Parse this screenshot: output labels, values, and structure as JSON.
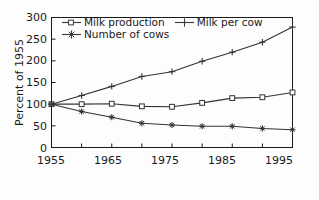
{
  "chart_data": {
    "type": "line",
    "title": "",
    "xlabel": "",
    "ylabel": "Percent of 1955",
    "x": [
      1955,
      1960,
      1965,
      1970,
      1975,
      1980,
      1985,
      1990,
      1995
    ],
    "xlim": [
      1955,
      1995
    ],
    "ylim": [
      0,
      300
    ],
    "xticks": [
      1955,
      1960,
      1965,
      1970,
      1975,
      1980,
      1985,
      1990,
      1995
    ],
    "xticklabels": [
      "1955",
      "",
      "1965",
      "",
      "1975",
      "",
      "1985",
      "",
      "1995"
    ],
    "yticks": [
      0,
      50,
      100,
      150,
      200,
      250,
      300
    ],
    "yticklabels": [
      "0",
      "50",
      "100",
      "150",
      "200",
      "250",
      "300"
    ],
    "grid": false,
    "legend_position": "upper left (inside axes)",
    "series": [
      {
        "name": "Milk production",
        "marker": "open-square",
        "color": "#333333",
        "values": [
          100,
          100,
          101,
          95,
          94,
          103,
          114,
          116,
          127
        ]
      },
      {
        "name": "Milk per cow",
        "marker": "plus",
        "color": "#333333",
        "values": [
          100,
          120,
          141,
          164,
          175,
          199,
          220,
          243,
          278
        ]
      },
      {
        "name": "Number of cows",
        "marker": "star",
        "color": "#333333",
        "values": [
          100,
          83,
          70,
          56,
          52,
          49,
          49,
          44,
          41
        ]
      }
    ]
  },
  "legend": {
    "rows": [
      [
        {
          "label": "Milk production",
          "marker": "open-square"
        },
        {
          "label": "Milk per cow",
          "marker": "plus"
        }
      ],
      [
        {
          "label": "Number of cows",
          "marker": "star"
        }
      ]
    ]
  },
  "axis": {
    "y_title": "Percent of 1955",
    "y_labels": [
      "300",
      "250",
      "200",
      "150",
      "100",
      "50",
      "0"
    ],
    "x_labels": [
      "1955",
      "1965",
      "1975",
      "1985",
      "1995"
    ]
  },
  "style": {
    "axis_color": "#1a1a1a",
    "line_color": "#3a3a3a",
    "background": "#fdfdfd"
  }
}
